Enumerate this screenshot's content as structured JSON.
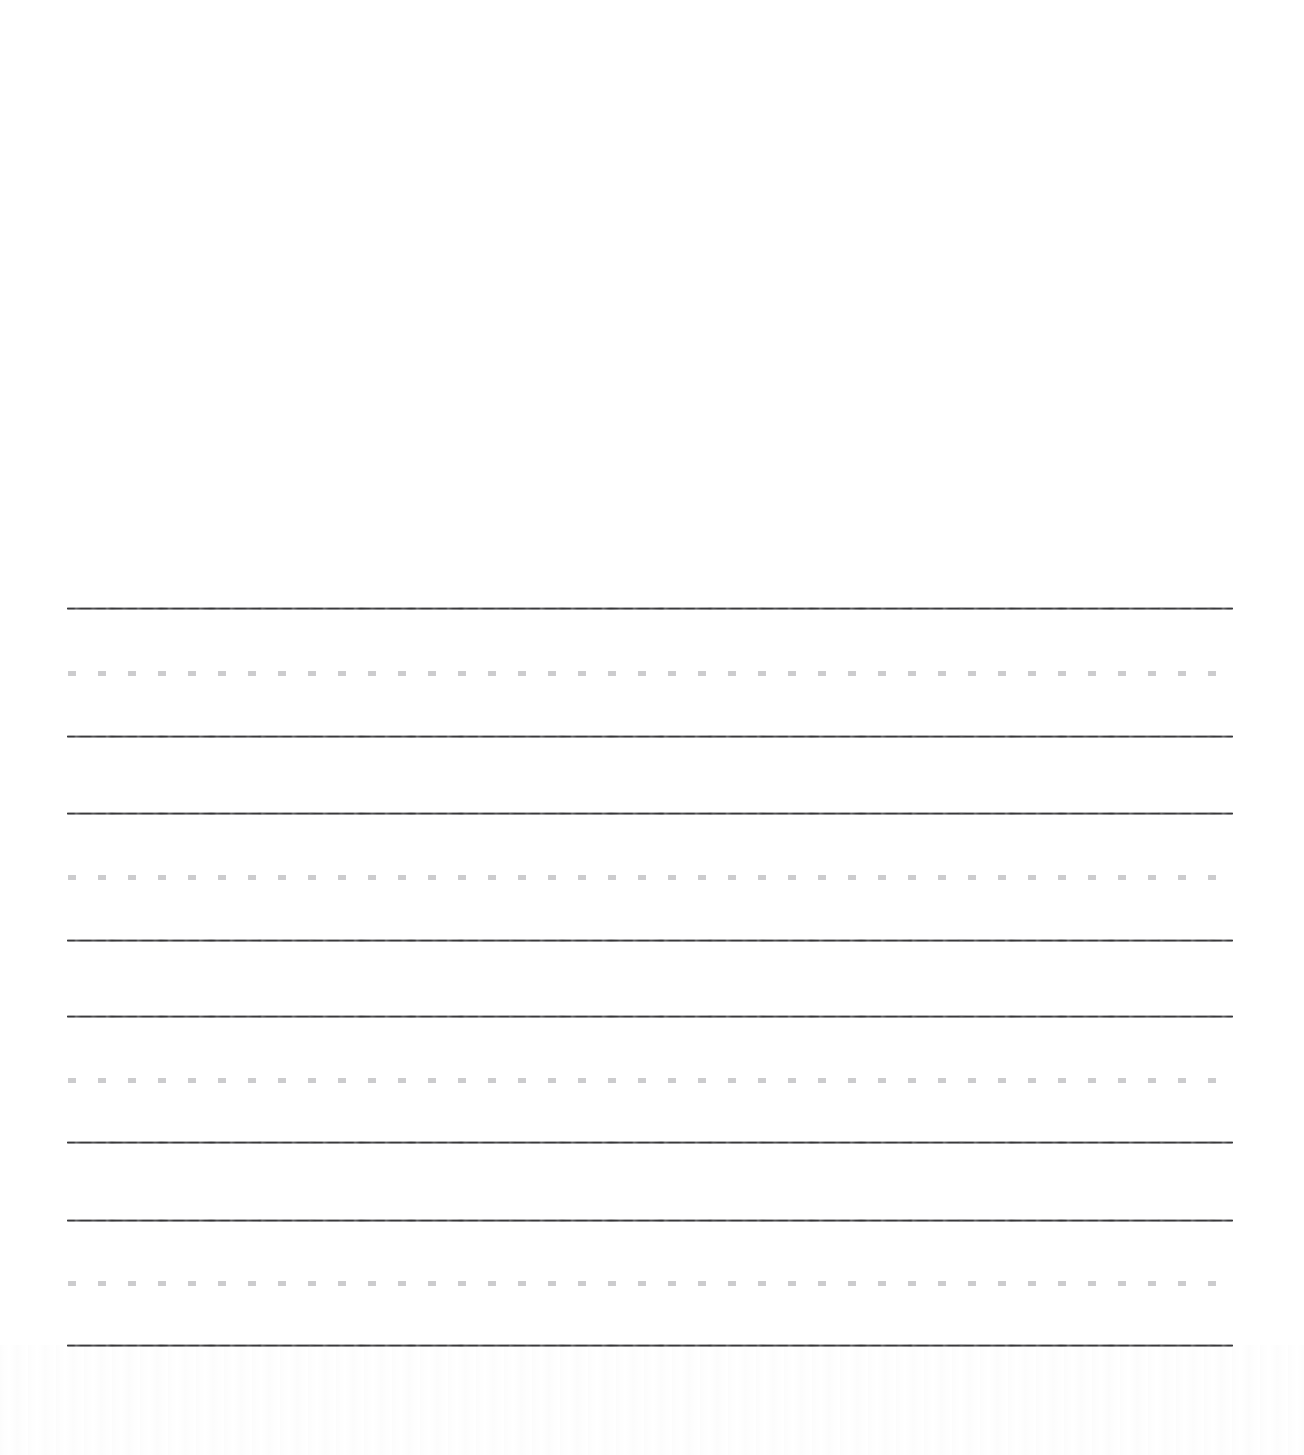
{
  "document": {
    "kind": "handwriting-practice-paper",
    "title": "Handwriting Practice Paper",
    "background_color": "#ffffff",
    "page_width": 1304,
    "page_height": 1455,
    "visible_text": "",
    "blank_region": {
      "label": "blank upper area",
      "top": 0,
      "height": 595
    }
  },
  "rules": {
    "solid_color": "#3a3a3c",
    "dashed_color": "#c9c9cb",
    "solid_thickness": 3,
    "dashed_thickness": 5,
    "dash_length": 8,
    "dash_gap": 22,
    "left": 67,
    "right": 1233,
    "width": 1166
  },
  "line_groups": [
    {
      "name": "writing-line-group-1",
      "top_rule_y": 607,
      "midline_y": 671,
      "baseline_y": 735
    },
    {
      "name": "writing-line-group-2",
      "top_rule_y": 812,
      "midline_y": 875,
      "baseline_y": 939
    },
    {
      "name": "writing-line-group-3",
      "top_rule_y": 1015,
      "midline_y": 1078,
      "baseline_y": 1141
    },
    {
      "name": "writing-line-group-4",
      "top_rule_y": 1219,
      "midline_y": 1281,
      "baseline_y": 1344
    }
  ]
}
